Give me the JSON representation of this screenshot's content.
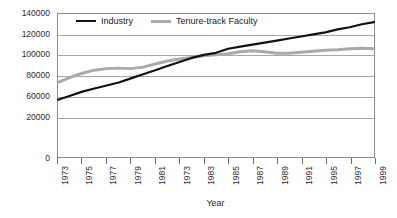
{
  "chart_data": {
    "type": "line",
    "title": "",
    "xlabel": "Year",
    "ylabel": "",
    "grid": "horizontal",
    "legend_position": "top-inside",
    "xlim": [
      1973,
      1999
    ],
    "ylim": [
      0,
      140000
    ],
    "y_tick_labels": [
      "140000",
      "120000",
      "100000",
      "80000",
      "60000",
      "20000",
      "0"
    ],
    "y_tick_values": [
      140000,
      120000,
      100000,
      80000,
      60000,
      40000,
      0
    ],
    "x_tick_labels": [
      "1973",
      "1975",
      "1977",
      "1979",
      "1981",
      "1973",
      "1983",
      "1985",
      "1987",
      "1989",
      "1991",
      "1995",
      "1997",
      "1999"
    ],
    "x": [
      1973,
      1974,
      1975,
      1976,
      1977,
      1978,
      1979,
      1980,
      1981,
      1982,
      1983,
      1984,
      1985,
      1986,
      1987,
      1988,
      1989,
      1990,
      1991,
      1992,
      1993,
      1994,
      1995,
      1996,
      1997,
      1998,
      1999
    ],
    "series": [
      {
        "name": "Industry",
        "color": "#111111",
        "values": [
          56000,
          60000,
          64000,
          67000,
          70000,
          73000,
          77000,
          81000,
          85000,
          89000,
          93000,
          97000,
          100000,
          102000,
          106000,
          108000,
          110000,
          112000,
          114000,
          116000,
          118000,
          120000,
          122000,
          125000,
          127000,
          130000,
          132000
        ]
      },
      {
        "name": "Tenure-track Faculty",
        "color": "#aaaaaa",
        "values": [
          73000,
          78000,
          82000,
          85000,
          86500,
          87000,
          86500,
          88000,
          91000,
          94000,
          96000,
          97500,
          99000,
          100000,
          101000,
          103000,
          104000,
          103000,
          101500,
          101500,
          102500,
          103500,
          104500,
          105000,
          106000,
          106500,
          106000
        ]
      }
    ]
  },
  "legend": {
    "industry_label": "Industry",
    "faculty_label": "Tenure-track Faculty"
  },
  "axis": {
    "x_title": "Year"
  }
}
